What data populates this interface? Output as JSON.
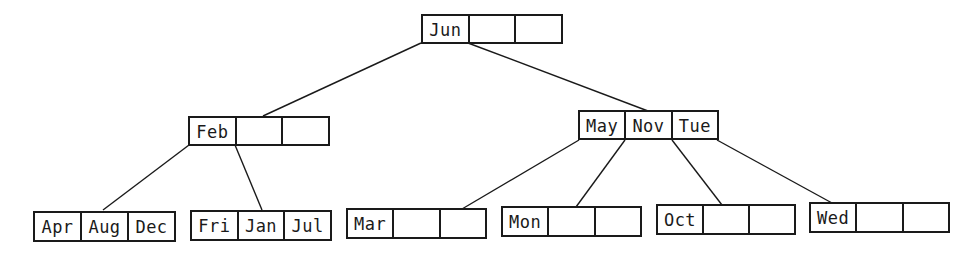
{
  "diagram": {
    "type": "b-tree",
    "line_color": "#1a1a1a",
    "root": {
      "keys": [
        "Jun",
        "",
        ""
      ]
    },
    "level1": [
      {
        "id": "feb-node",
        "keys": [
          "Feb",
          "",
          ""
        ]
      },
      {
        "id": "may-nov-tue-node",
        "keys": [
          "May",
          "Nov",
          "Tue"
        ]
      }
    ],
    "leaves": [
      {
        "id": "apr-aug-dec-node",
        "keys": [
          "Apr",
          "Aug",
          "Dec"
        ]
      },
      {
        "id": "fri-jan-jul-node",
        "keys": [
          "Fri",
          "Jan",
          "Jul"
        ]
      },
      {
        "id": "mar-node",
        "keys": [
          "Mar",
          "",
          ""
        ]
      },
      {
        "id": "mon-node",
        "keys": [
          "Mon",
          "",
          ""
        ]
      },
      {
        "id": "oct-node",
        "keys": [
          "Oct",
          "",
          ""
        ]
      },
      {
        "id": "wed-node",
        "keys": [
          "Wed",
          "",
          ""
        ]
      }
    ],
    "edges": [
      {
        "from": "root",
        "to": "feb-node"
      },
      {
        "from": "root",
        "to": "may-nov-tue-node"
      },
      {
        "from": "feb-node",
        "to": "apr-aug-dec-node"
      },
      {
        "from": "feb-node",
        "to": "fri-jan-jul-node"
      },
      {
        "from": "may-nov-tue-node",
        "to": "mar-node"
      },
      {
        "from": "may-nov-tue-node",
        "to": "mon-node"
      },
      {
        "from": "may-nov-tue-node",
        "to": "oct-node"
      },
      {
        "from": "may-nov-tue-node",
        "to": "wed-node"
      }
    ]
  }
}
